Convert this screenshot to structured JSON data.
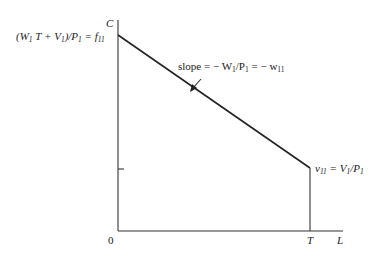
{
  "diagram": {
    "type": "budget-line",
    "axes": {
      "y_label": "C",
      "x_label": "L",
      "origin_label": "0",
      "x_tick_label": "T"
    },
    "intercept_label": {
      "main": "(W",
      "s1": "1",
      "mid": " T + V",
      "s2": "1",
      "tail": ")/P",
      "s3": "1",
      "eq": " = f",
      "s4": "11"
    },
    "slope_label": {
      "main": "slope = − W",
      "s1": "1",
      "mid": "/P",
      "s2": "1",
      "tail": " = − w",
      "s3": "11"
    },
    "endpoint_label": {
      "main": "v",
      "s1": "11",
      "mid": " = V",
      "s2": "1",
      "tail": "/P",
      "s3": "1"
    },
    "colors": {
      "line": "#222222",
      "axis": "#333333",
      "background": "#ffffff"
    }
  }
}
